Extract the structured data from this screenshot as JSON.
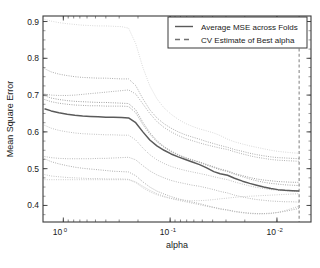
{
  "figure": {
    "background": "#ffffff",
    "frame_color": "#3a3a3a",
    "caption_text": ""
  },
  "chart_data": {
    "type": "line",
    "title": "",
    "xlabel": "alpha",
    "ylabel": "Mean Square Error",
    "x_scale": "log",
    "x_reversed": true,
    "xlim": [
      1.55,
      0.0048
    ],
    "ylim": [
      0.355,
      0.915
    ],
    "y_ticks": [
      0.4,
      0.5,
      0.6,
      0.7,
      0.8,
      0.9
    ],
    "y_tick_labels": [
      "0.4",
      "0.5",
      "0.6",
      "0.7",
      "0.8",
      "0.9"
    ],
    "x_ticks": [
      1,
      0.1,
      0.01
    ],
    "x_tick_labels": [
      "10^0",
      "10^-1",
      "10^-2"
    ],
    "x_tick_mantissa": [
      "10",
      "10",
      "10"
    ],
    "x_tick_exponent": [
      "0",
      "-1",
      "-2"
    ],
    "grid": false,
    "legend_position": "top-right",
    "legend": [
      {
        "label": "Average MSE across Folds",
        "style": "solid",
        "color": "#5a5a5a"
      },
      {
        "label": "CV Estimate of Best alpha",
        "style": "dashed",
        "color": "#707070"
      }
    ],
    "best_alpha": 0.0062,
    "best_alpha_line": {
      "style": "dashed",
      "color": "#8a8a8a"
    },
    "x": [
      1.5,
      1.3,
      1.1,
      0.92,
      0.78,
      0.66,
      0.56,
      0.47,
      0.4,
      0.34,
      0.285,
      0.245,
      0.21,
      0.18,
      0.155,
      0.133,
      0.114,
      0.098,
      0.084,
      0.072,
      0.062,
      0.053,
      0.046,
      0.039,
      0.034,
      0.029,
      0.025,
      0.021,
      0.018,
      0.0155,
      0.0133,
      0.0114,
      0.0098,
      0.0084,
      0.0072,
      0.0062
    ],
    "average_series": {
      "name": "Average MSE across Folds",
      "color": "#5a5a5a",
      "style": "solid",
      "values": [
        0.663,
        0.657,
        0.652,
        0.648,
        0.645,
        0.643,
        0.642,
        0.641,
        0.64,
        0.64,
        0.639,
        0.638,
        0.625,
        0.6,
        0.578,
        0.562,
        0.55,
        0.54,
        0.532,
        0.525,
        0.518,
        0.511,
        0.503,
        0.492,
        0.486,
        0.482,
        0.474,
        0.466,
        0.46,
        0.455,
        0.45,
        0.446,
        0.443,
        0.441,
        0.44,
        0.439
      ]
    },
    "fold_series": [
      {
        "name": "fold-1",
        "color": "#d0d0d0",
        "style": "dotted",
        "values": [
          0.906,
          0.901,
          0.897,
          0.894,
          0.892,
          0.89,
          0.889,
          0.888,
          0.888,
          0.887,
          0.886,
          0.882,
          0.84,
          0.775,
          0.725,
          0.69,
          0.665,
          0.648,
          0.634,
          0.623,
          0.615,
          0.608,
          0.603,
          0.597,
          0.59,
          0.58,
          0.573,
          0.567,
          0.562,
          0.558,
          0.554,
          0.55,
          0.547,
          0.545,
          0.543,
          0.542
        ]
      },
      {
        "name": "fold-2",
        "color": "#9a9a9a",
        "style": "dotted",
        "values": [
          0.772,
          0.763,
          0.757,
          0.753,
          0.75,
          0.748,
          0.747,
          0.746,
          0.746,
          0.745,
          0.744,
          0.744,
          0.726,
          0.69,
          0.66,
          0.638,
          0.622,
          0.61,
          0.6,
          0.592,
          0.586,
          0.58,
          0.574,
          0.568,
          0.563,
          0.558,
          0.552,
          0.547,
          0.542,
          0.538,
          0.535,
          0.532,
          0.53,
          0.529,
          0.528,
          0.527
        ]
      },
      {
        "name": "fold-3",
        "color": "#a0a0a0",
        "style": "dotted",
        "values": [
          0.703,
          0.7,
          0.699,
          0.699,
          0.7,
          0.702,
          0.704,
          0.706,
          0.708,
          0.71,
          0.712,
          0.714,
          0.703,
          0.676,
          0.65,
          0.628,
          0.612,
          0.6,
          0.59,
          0.582,
          0.576,
          0.57,
          0.565,
          0.56,
          0.556,
          0.552,
          0.546,
          0.54,
          0.535,
          0.531,
          0.528,
          0.525,
          0.523,
          0.522,
          0.521,
          0.52
        ]
      },
      {
        "name": "fold-4",
        "color": "#8c8c8c",
        "style": "dotted",
        "values": [
          0.698,
          0.692,
          0.688,
          0.685,
          0.683,
          0.682,
          0.681,
          0.68,
          0.68,
          0.679,
          0.678,
          0.677,
          0.66,
          0.626,
          0.598,
          0.576,
          0.56,
          0.548,
          0.538,
          0.53,
          0.524,
          0.518,
          0.512,
          0.505,
          0.499,
          0.494,
          0.487,
          0.481,
          0.476,
          0.472,
          0.469,
          0.467,
          0.465,
          0.464,
          0.463,
          0.463
        ]
      },
      {
        "name": "fold-5",
        "color": "#939393",
        "style": "dotted",
        "values": [
          0.688,
          0.682,
          0.678,
          0.675,
          0.673,
          0.672,
          0.671,
          0.671,
          0.67,
          0.67,
          0.67,
          0.669,
          0.652,
          0.62,
          0.594,
          0.573,
          0.558,
          0.546,
          0.537,
          0.529,
          0.523,
          0.517,
          0.51,
          0.503,
          0.497,
          0.492,
          0.485,
          0.478,
          0.472,
          0.467,
          0.463,
          0.46,
          0.458,
          0.456,
          0.455,
          0.454
        ]
      },
      {
        "name": "fold-6",
        "color": "#b4b4b4",
        "style": "dotted",
        "values": [
          0.618,
          0.61,
          0.604,
          0.6,
          0.597,
          0.595,
          0.594,
          0.593,
          0.592,
          0.592,
          0.591,
          0.591,
          0.578,
          0.556,
          0.538,
          0.524,
          0.514,
          0.506,
          0.5,
          0.495,
          0.491,
          0.487,
          0.483,
          0.478,
          0.474,
          0.47,
          0.464,
          0.458,
          0.453,
          0.449,
          0.446,
          0.443,
          0.441,
          0.44,
          0.439,
          0.438
        ]
      },
      {
        "name": "fold-7",
        "color": "#aaaaaa",
        "style": "dotted",
        "values": [
          0.533,
          0.53,
          0.528,
          0.527,
          0.527,
          0.527,
          0.527,
          0.528,
          0.528,
          0.529,
          0.53,
          0.531,
          0.524,
          0.508,
          0.494,
          0.483,
          0.475,
          0.468,
          0.463,
          0.459,
          0.455,
          0.452,
          0.448,
          0.443,
          0.438,
          0.434,
          0.428,
          0.423,
          0.419,
          0.416,
          0.414,
          0.412,
          0.411,
          0.41,
          0.41,
          0.409
        ]
      },
      {
        "name": "fold-8",
        "color": "#9e9e9e",
        "style": "dotted",
        "values": [
          0.527,
          0.519,
          0.513,
          0.508,
          0.504,
          0.501,
          0.499,
          0.497,
          0.495,
          0.493,
          0.492,
          0.491,
          0.481,
          0.464,
          0.45,
          0.439,
          0.431,
          0.424,
          0.418,
          0.413,
          0.409,
          0.405,
          0.4,
          0.395,
          0.391,
          0.388,
          0.384,
          0.381,
          0.379,
          0.378,
          0.378,
          0.379,
          0.381,
          0.384,
          0.388,
          0.392
        ]
      },
      {
        "name": "fold-9",
        "color": "#b8b8b8",
        "style": "dotted",
        "values": [
          0.484,
          0.48,
          0.478,
          0.476,
          0.475,
          0.474,
          0.473,
          0.473,
          0.472,
          0.472,
          0.472,
          0.471,
          0.464,
          0.452,
          0.441,
          0.432,
          0.425,
          0.419,
          0.414,
          0.41,
          0.406,
          0.402,
          0.398,
          0.394,
          0.39,
          0.387,
          0.383,
          0.38,
          0.378,
          0.377,
          0.377,
          0.378,
          0.381,
          0.386,
          0.392,
          0.398
        ]
      },
      {
        "name": "fold-10",
        "color": "#c2c2c2",
        "style": "dotted",
        "values": [
          0.47,
          0.47,
          0.47,
          0.47,
          0.47,
          0.47,
          0.47,
          0.47,
          0.47,
          0.47,
          0.47,
          0.47,
          0.462,
          0.448,
          0.437,
          0.429,
          0.423,
          0.419,
          0.416,
          0.414,
          0.413,
          0.413,
          0.414,
          0.416,
          0.418,
          0.42,
          0.422,
          0.424,
          0.425,
          0.426,
          0.427,
          0.428,
          0.429,
          0.43,
          0.431,
          0.432
        ]
      }
    ]
  }
}
